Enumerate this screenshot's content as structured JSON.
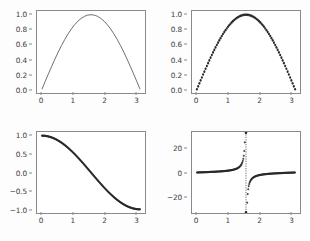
{
  "figure": {
    "background_color": "#fdfdfd",
    "axes_background_color": "#ffffff",
    "frame_color": "#8a8a8a",
    "line_color": "#4a4a4a",
    "marker_color": "#2b2b2b",
    "rows": 2,
    "cols": 2
  },
  "chart_data": [
    {
      "type": "line",
      "panel": "top-left",
      "title": "",
      "xlabel": "",
      "ylabel": "",
      "style": "solid-line",
      "xlim": [
        -0.157,
        3.299
      ],
      "ylim": [
        -0.05,
        1.05
      ],
      "xticks": [
        "0",
        "1",
        "2",
        "3"
      ],
      "xtick_values": [
        0,
        1,
        2,
        3
      ],
      "yticks": [
        "0.0",
        "0.2",
        "0.4",
        "0.6",
        "0.8",
        "1.0"
      ],
      "ytick_values": [
        0.0,
        0.2,
        0.4,
        0.6,
        0.8,
        1.0
      ],
      "grid": false,
      "legend": "none",
      "series": [
        {
          "name": "sin(x)",
          "x": [
            0.0,
            0.1047,
            0.2094,
            0.3142,
            0.4189,
            0.5236,
            0.6283,
            0.733,
            0.8378,
            0.9425,
            1.0472,
            1.1519,
            1.2566,
            1.3614,
            1.4661,
            1.5708,
            1.6755,
            1.7802,
            1.885,
            1.9897,
            2.0944,
            2.1991,
            2.3038,
            2.4086,
            2.5133,
            2.618,
            2.7227,
            2.8274,
            2.9322,
            3.0369,
            3.1416
          ],
          "y": [
            0.0,
            0.1045,
            0.2079,
            0.309,
            0.4067,
            0.5,
            0.5878,
            0.6691,
            0.7431,
            0.809,
            0.866,
            0.9135,
            0.9511,
            0.9781,
            0.9945,
            1.0,
            0.9945,
            0.9781,
            0.9511,
            0.9135,
            0.866,
            0.809,
            0.7431,
            0.6691,
            0.5878,
            0.5,
            0.4067,
            0.309,
            0.2079,
            0.1045,
            0.0
          ]
        }
      ]
    },
    {
      "type": "scatter",
      "panel": "top-right",
      "title": "",
      "xlabel": "",
      "ylabel": "",
      "style": "round-markers",
      "xlim": [
        -0.157,
        3.299
      ],
      "ylim": [
        -0.05,
        1.05
      ],
      "xticks": [
        "0",
        "1",
        "2",
        "3"
      ],
      "xtick_values": [
        0,
        1,
        2,
        3
      ],
      "yticks": [
        "0.0",
        "0.2",
        "0.4",
        "0.6",
        "0.8",
        "1.0"
      ],
      "ytick_values": [
        0.0,
        0.2,
        0.4,
        0.6,
        0.8,
        1.0
      ],
      "grid": false,
      "legend": "none",
      "series": [
        {
          "name": "sin(x)",
          "marker": "circle",
          "n_points": 80
        }
      ]
    },
    {
      "type": "scatter",
      "panel": "bottom-left",
      "title": "",
      "xlabel": "",
      "ylabel": "",
      "style": "dense-markers",
      "xlim": [
        -0.157,
        3.299
      ],
      "ylim": [
        -1.1,
        1.1
      ],
      "xticks": [
        "0",
        "1",
        "2",
        "3"
      ],
      "xtick_values": [
        0,
        1,
        2,
        3
      ],
      "yticks": [
        "-1.0",
        "-0.5",
        "0.0",
        "0.5",
        "1.0"
      ],
      "ytick_values": [
        -1.0,
        -0.5,
        0.0,
        0.5,
        1.0
      ],
      "grid": false,
      "legend": "none",
      "series": [
        {
          "name": "cos(x)",
          "marker": "plus",
          "n_points": 200
        }
      ]
    },
    {
      "type": "scatter",
      "panel": "bottom-right",
      "title": "",
      "xlabel": "",
      "ylabel": "",
      "style": "dense-markers-asymptote",
      "xlim": [
        -0.157,
        3.299
      ],
      "ylim": [
        -34,
        34
      ],
      "xticks": [
        "0",
        "1",
        "2",
        "3"
      ],
      "xtick_values": [
        0,
        1,
        2,
        3
      ],
      "yticks": [
        "-20",
        "0",
        "20"
      ],
      "ytick_values": [
        -20,
        0,
        20
      ],
      "grid": false,
      "legend": "none",
      "asymptote_x": 1.5708,
      "series": [
        {
          "name": "tan(x)",
          "marker": "plus",
          "n_points": 200
        }
      ]
    }
  ]
}
